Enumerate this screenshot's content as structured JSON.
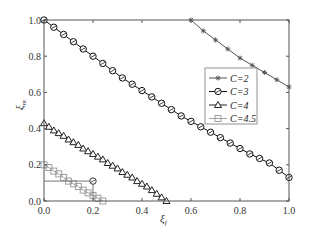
{
  "chart_data": {
    "type": "line",
    "title": "",
    "xlabel": "ξf",
    "ylabel": "ξm",
    "xlim": [
      0.0,
      1.0
    ],
    "ylim": [
      0.0,
      1.0
    ],
    "xticks": [
      "0.0",
      "0.2",
      "0.4",
      "0.6",
      "0.8",
      "1.0"
    ],
    "yticks": [
      "0.0",
      "0.2",
      "0.4",
      "0.6",
      "0.8",
      "1.0"
    ],
    "grid": false,
    "legend_position": "center-right",
    "series": [
      {
        "name": "C=2",
        "marker": "star",
        "color": "#555555",
        "x": [
          0.6,
          0.65,
          0.7,
          0.75,
          0.8,
          0.85,
          0.9,
          0.95,
          1.0
        ],
        "y": [
          1.0,
          0.94,
          0.89,
          0.84,
          0.79,
          0.75,
          0.71,
          0.67,
          0.63
        ]
      },
      {
        "name": "C=3",
        "marker": "circle",
        "color": "#111111",
        "x": [
          0.0,
          0.04,
          0.08,
          0.12,
          0.16,
          0.2,
          0.24,
          0.28,
          0.32,
          0.36,
          0.4,
          0.44,
          0.48,
          0.52,
          0.56,
          0.6,
          0.64,
          0.68,
          0.72,
          0.76,
          0.8,
          0.84,
          0.88,
          0.92,
          0.96,
          1.0
        ],
        "y": [
          1.0,
          0.96,
          0.92,
          0.88,
          0.84,
          0.8,
          0.76,
          0.72,
          0.68,
          0.645,
          0.61,
          0.575,
          0.54,
          0.505,
          0.47,
          0.44,
          0.41,
          0.38,
          0.35,
          0.32,
          0.29,
          0.26,
          0.235,
          0.21,
          0.17,
          0.13
        ]
      },
      {
        "name": "C=4",
        "marker": "triangle",
        "color": "#222222",
        "x": [
          0.0,
          0.02,
          0.04,
          0.06,
          0.08,
          0.1,
          0.12,
          0.14,
          0.16,
          0.18,
          0.2,
          0.22,
          0.24,
          0.26,
          0.28,
          0.3,
          0.32,
          0.34,
          0.36,
          0.38,
          0.4,
          0.42,
          0.44,
          0.46,
          0.48,
          0.5
        ],
        "y": [
          0.43,
          0.41,
          0.39,
          0.375,
          0.36,
          0.34,
          0.325,
          0.31,
          0.29,
          0.275,
          0.26,
          0.245,
          0.23,
          0.21,
          0.195,
          0.18,
          0.16,
          0.145,
          0.13,
          0.11,
          0.095,
          0.08,
          0.06,
          0.04,
          0.02,
          0.0
        ]
      },
      {
        "name": "C=4.5",
        "marker": "square",
        "color": "#a0a0a0",
        "x": [
          0.0,
          0.02,
          0.04,
          0.06,
          0.08,
          0.1,
          0.12,
          0.14,
          0.16,
          0.18,
          0.2,
          0.22,
          0.24
        ],
        "y": [
          0.2,
          0.185,
          0.165,
          0.15,
          0.13,
          0.11,
          0.095,
          0.08,
          0.06,
          0.045,
          0.03,
          0.015,
          0.0
        ]
      }
    ],
    "annotations": [
      {
        "type": "guide-lines",
        "point": [
          0.2,
          0.11
        ],
        "marker": "circle",
        "description": "horizontal line from y-axis and vertical line to x-axis meeting at marked point"
      }
    ]
  },
  "axes": {
    "x_label_main": "ξ",
    "x_label_sub": "f",
    "y_label_main": "ξ",
    "y_label_sub": "m"
  },
  "legend": {
    "items": [
      {
        "label": "C=2"
      },
      {
        "label": "C=3"
      },
      {
        "label": "C=4"
      },
      {
        "label": "C=4.5"
      }
    ]
  }
}
